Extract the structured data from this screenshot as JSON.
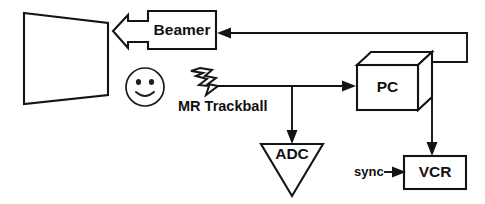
{
  "diagram": {
    "background_color": "#ffffff",
    "line_color": "#141414",
    "nodes": {
      "screen": {
        "label": "",
        "shape": "trapezoid-projection-screen"
      },
      "beamer": {
        "label": "Beamer",
        "shape": "rectangle-with-left-block-arrow"
      },
      "observer": {
        "label": "",
        "shape": "smiley-face"
      },
      "trackball": {
        "label": "MR Trackball",
        "shape": "lightning-bolt"
      },
      "adc": {
        "label": "ADC",
        "shape": "down-triangle"
      },
      "pc": {
        "label": "PC",
        "shape": "3d-cube"
      },
      "vcr": {
        "label": "VCR",
        "shape": "rectangle"
      },
      "sync": {
        "label": "sync",
        "shape": "text-with-arrow"
      }
    },
    "connections": [
      {
        "from": "beamer",
        "to": "screen",
        "style": "block-arrow"
      },
      {
        "from": "pc",
        "to": "beamer",
        "style": "arrow"
      },
      {
        "from": "trackball",
        "to": "pc",
        "style": "arrow"
      },
      {
        "from": "trackball",
        "to": "adc",
        "style": "arrow"
      },
      {
        "from": "pc",
        "to": "vcr",
        "style": "arrow"
      },
      {
        "from": "sync",
        "to": "vcr",
        "style": "arrow"
      }
    ]
  },
  "labels": {
    "beamer": "Beamer",
    "mr_trackball": "MR Trackball",
    "adc": "ADC",
    "pc": "PC",
    "vcr": "VCR",
    "sync": "sync"
  }
}
